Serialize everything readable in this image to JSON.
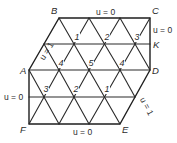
{
  "diagram": {
    "type": "triangular finite-element mesh",
    "stroke_color": "#2a2a2a",
    "background": "#ffffff",
    "vertices": {
      "A": "A",
      "B": "B",
      "C": "C",
      "D": "D",
      "E": "E",
      "F": "F",
      "K": "K"
    },
    "boundary_conditions": {
      "top_BC": "u = 0",
      "right_CK": "u = 0",
      "left_AB": "u = 1",
      "left_FA": "u = 0",
      "bottom_FE": "u = 0",
      "right_DE": "u = 1"
    },
    "node_numbers": {
      "upper_row_1": "1",
      "upper_row_2": "2",
      "upper_row_3": "3",
      "middle_row_4a": "4",
      "middle_row_5": "5",
      "middle_row_4b": "4",
      "lower_row_3": "3",
      "lower_row_2": "2",
      "lower_row_1": "1"
    }
  }
}
